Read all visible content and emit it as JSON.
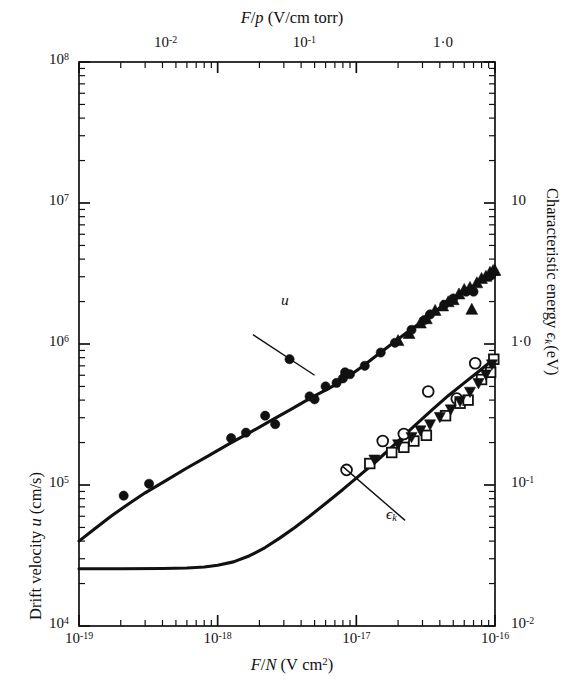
{
  "figure": {
    "top_axis_title_plain": "F/p (V/cm torr)",
    "bottom_axis_title_plain": "F/N (V cm2)",
    "left_axis_title_plain": "Drift velocity u (cm/s)",
    "right_axis_title_plain": "Characteristic energy ϵk (eV)"
  },
  "labels": {
    "u_curve": "u",
    "ek_curve": "ϵk"
  },
  "chart_data": {
    "type": "scatter",
    "title": "",
    "subtitle": "",
    "xlabel": "F/N (V cm²)",
    "xlabel_top": "F/p (V/cm torr)",
    "ylabel": "Drift velocity u (cm/s)",
    "ylabel_right": "Characteristic energy ϵk (eV)",
    "xscale": "log",
    "yscale": "log",
    "grid": false,
    "legend": "none",
    "xlim": [
      1e-19,
      1e-16
    ],
    "ylim": [
      10000.0,
      100000000.0
    ],
    "ylim_right": [
      0.01,
      100
    ],
    "xlim_top": [
      0.00237,
      2.37
    ],
    "xticks": [
      "10⁻¹⁹",
      "10⁻¹⁸",
      "10⁻¹⁷",
      "10⁻¹⁶"
    ],
    "xtick_values": [
      1e-19,
      1e-18,
      1e-17,
      1e-16
    ],
    "xticks_top": [
      "10⁻²",
      "10⁻¹",
      "1·0"
    ],
    "xtick_top_values": [
      0.01,
      0.1,
      1.0
    ],
    "yticks": [
      "10⁴",
      "10⁵",
      "10⁶",
      "10⁷",
      "10⁸"
    ],
    "ytick_values": [
      10000.0,
      100000.0,
      1000000.0,
      10000000.0,
      100000000.0
    ],
    "yticks_right": [
      "10⁻²",
      "10⁻¹",
      "1·0",
      "10"
    ],
    "ytick_right_values": [
      0.01,
      0.1,
      1.0,
      10
    ],
    "annotations": [
      {
        "text": "u",
        "x": 1.6e-18,
        "y": 1350000.0,
        "leader_to_x": 5e-18,
        "leader_to_y": 600000.0
      },
      {
        "text": "ϵk",
        "x": 2e-17,
        "y": 65000.0,
        "leader_to_x": 8e-18,
        "leader_to_y": 135000.0
      }
    ],
    "series": [
      {
        "name": "u theory curve",
        "type": "line",
        "marker": "none",
        "points": [
          [
            1e-19,
            40000.0
          ],
          [
            1.3e-19,
            49000.0
          ],
          [
            1.7e-19,
            60000.0
          ],
          [
            2.3e-19,
            74000.0
          ],
          [
            3e-19,
            88000.0
          ],
          [
            4.2e-19,
            107000.0
          ],
          [
            6e-19,
            132000.0
          ],
          [
            8.5e-19,
            160000.0
          ],
          [
            1.2e-18,
            195000.0
          ],
          [
            1.7e-18,
            235000.0
          ],
          [
            2.4e-18,
            285000.0
          ],
          [
            3.4e-18,
            345000.0
          ],
          [
            4.8e-18,
            420000.0
          ],
          [
            6e-18,
            470000.0
          ],
          [
            7.5e-18,
            530000.0
          ],
          [
            9e-18,
            600000.0
          ],
          [
            1.1e-17,
            690000.0
          ],
          [
            1.4e-17,
            830000.0
          ],
          [
            1.8e-17,
            1000000.0
          ],
          [
            2.3e-17,
            1200000.0
          ],
          [
            3e-17,
            1450000.0
          ],
          [
            4e-17,
            1800000.0
          ],
          [
            5.2e-17,
            2150000.0
          ],
          [
            6.5e-17,
            2450000.0
          ],
          [
            8e-17,
            2800000.0
          ],
          [
            9e-17,
            3000000.0
          ],
          [
            1e-16,
            3200000.0
          ]
        ]
      },
      {
        "name": "epsilon_k theory curve",
        "type": "line",
        "marker": "none",
        "points": [
          [
            1e-19,
            25500.0
          ],
          [
            2e-19,
            25500.0
          ],
          [
            4e-19,
            25600.0
          ],
          [
            6e-19,
            25800.0
          ],
          [
            8e-19,
            26200.0
          ],
          [
            1e-18,
            27000.0
          ],
          [
            1.3e-18,
            28500.0
          ],
          [
            1.7e-18,
            31500.0
          ],
          [
            2.2e-18,
            36000.0
          ],
          [
            2.8e-18,
            42000.0
          ],
          [
            3.6e-18,
            50000.0
          ],
          [
            4.6e-18,
            60000.0
          ],
          [
            6e-18,
            74000.0
          ],
          [
            8e-18,
            93000.0
          ],
          [
            1e-17,
            112000.0
          ],
          [
            1.4e-17,
            148000.0
          ],
          [
            1.9e-17,
            195000.0
          ],
          [
            2.6e-17,
            260000.0
          ],
          [
            3.5e-17,
            340000.0
          ],
          [
            4.6e-17,
            430000.0
          ],
          [
            6e-17,
            530000.0
          ],
          [
            7.5e-17,
            630000.0
          ],
          [
            9e-17,
            730000.0
          ],
          [
            1e-16,
            820000.0
          ]
        ]
      },
      {
        "name": "u filled circles",
        "type": "scatter",
        "marker": "filled-circle",
        "points": [
          [
            2.1e-19,
            84000.0
          ],
          [
            3.2e-19,
            102000.0
          ],
          [
            1.25e-18,
            215000.0
          ],
          [
            1.6e-18,
            235000.0
          ],
          [
            2.2e-18,
            310000.0
          ],
          [
            2.6e-18,
            270000.0
          ],
          [
            3.3e-18,
            780000.0
          ],
          [
            4.6e-18,
            425000.0
          ],
          [
            5e-18,
            405000.0
          ],
          [
            6e-18,
            500000.0
          ],
          [
            7.2e-18,
            530000.0
          ],
          [
            8e-18,
            570000.0
          ],
          [
            8.3e-18,
            630000.0
          ],
          [
            9e-18,
            610000.0
          ],
          [
            1.15e-17,
            700000.0
          ],
          [
            1.5e-17,
            870000.0
          ],
          [
            1.9e-17,
            1020000.0
          ],
          [
            2.5e-17,
            1260000.0
          ],
          [
            3.1e-17,
            1480000.0
          ],
          [
            3.4e-17,
            1620000.0
          ],
          [
            4.3e-17,
            1900000.0
          ],
          [
            5e-17,
            2100000.0
          ],
          [
            6.2e-17,
            2350000.0
          ],
          [
            7e-17,
            2350000.0
          ],
          [
            9.3e-17,
            3050000.0
          ]
        ]
      },
      {
        "name": "u filled triangles",
        "type": "scatter",
        "marker": "filled-triangle-up",
        "points": [
          [
            2e-17,
            1050000.0
          ],
          [
            2.4e-17,
            1180000.0
          ],
          [
            2.9e-17,
            1400000.0
          ],
          [
            3.2e-17,
            1500000.0
          ],
          [
            3.7e-17,
            1720000.0
          ],
          [
            4.2e-17,
            1850000.0
          ],
          [
            4.6e-17,
            1980000.0
          ],
          [
            5e-17,
            2050000.0
          ],
          [
            5.5e-17,
            2250000.0
          ],
          [
            6e-17,
            2420000.0
          ],
          [
            6.6e-17,
            2500000.0
          ],
          [
            6.8e-17,
            1750000.0
          ],
          [
            7.4e-17,
            2700000.0
          ],
          [
            8e-17,
            2900000.0
          ],
          [
            8.6e-17,
            3000000.0
          ],
          [
            9.2e-17,
            3200000.0
          ],
          [
            9.7e-17,
            3300000.0
          ],
          [
            1e-16,
            3300000.0
          ]
        ]
      },
      {
        "name": "epsilon_k open circles",
        "type": "scatter",
        "marker": "open-circle",
        "points": [
          [
            8.5e-18,
            128000.0
          ],
          [
            1.55e-17,
            205000.0
          ],
          [
            2.2e-17,
            230000.0
          ],
          [
            3.3e-17,
            460000.0
          ],
          [
            5.3e-17,
            410000.0
          ],
          [
            7.2e-17,
            730000.0
          ]
        ]
      },
      {
        "name": "epsilon_k open squares",
        "type": "scatter",
        "marker": "open-square",
        "points": [
          [
            1.25e-17,
            142000.0
          ],
          [
            1.8e-17,
            170000.0
          ],
          [
            2.2e-17,
            185000.0
          ],
          [
            2.6e-17,
            205000.0
          ],
          [
            3.2e-17,
            225000.0
          ],
          [
            4.4e-17,
            310000.0
          ],
          [
            5.6e-17,
            380000.0
          ],
          [
            6.4e-17,
            400000.0
          ],
          [
            8e-17,
            560000.0
          ],
          [
            9.3e-17,
            630000.0
          ],
          [
            9.8e-17,
            780000.0
          ]
        ]
      },
      {
        "name": "epsilon_k filled down triangles",
        "type": "scatter",
        "marker": "filled-triangle-down",
        "points": [
          [
            1.35e-17,
            152000.0
          ],
          [
            2e-17,
            195000.0
          ],
          [
            2.5e-17,
            220000.0
          ],
          [
            2.9e-17,
            245000.0
          ],
          [
            3.4e-17,
            270000.0
          ],
          [
            4e-17,
            305000.0
          ],
          [
            4.8e-17,
            345000.0
          ],
          [
            5.6e-17,
            395000.0
          ],
          [
            6.6e-17,
            460000.0
          ],
          [
            7.6e-17,
            530000.0
          ],
          [
            8.6e-17,
            610000.0
          ],
          [
            9.5e-17,
            720000.0
          ]
        ]
      }
    ]
  }
}
